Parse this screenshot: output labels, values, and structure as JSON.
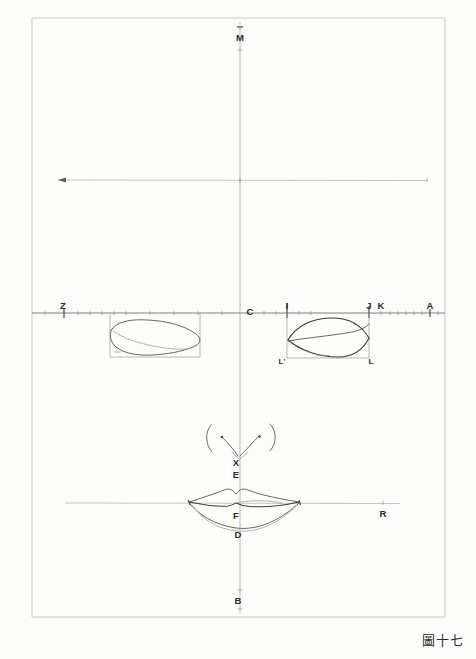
{
  "figure": {
    "caption": "圖十七",
    "caption_meaning": "Figure Seventeen",
    "sheet_width": 476,
    "sheet_height": 659,
    "background_color": "#fdfdfc",
    "ink_color": "#3c3c3a"
  },
  "frame": {
    "left": 32,
    "top": 18,
    "right": 445,
    "bottom": 617
  },
  "axes": {
    "vertical": {
      "label_top": "M",
      "label_bottom": "B",
      "x": 240,
      "y_top": 24,
      "y_bottom": 612
    },
    "horizontal_upper": {
      "label_left": "Z",
      "label_center": "C",
      "label_right": "A",
      "y": 313,
      "x_left": 32,
      "x_right": 445
    },
    "horizontal_mid": {
      "y": 180,
      "x_left": 57,
      "x_right": 428,
      "has_arrowhead_left": true
    },
    "horizontal_lower": {
      "label_right": "R",
      "y": 503,
      "x_left": 65,
      "x_right": 400
    }
  },
  "points": [
    {
      "id": "M",
      "label": "M",
      "x": 240,
      "y": 38,
      "desc": "top of vertical axis"
    },
    {
      "id": "Z",
      "label": "Z",
      "x": 63,
      "y": 306,
      "desc": "left end of upper horizontal axis"
    },
    {
      "id": "C",
      "label": "C",
      "x": 250,
      "y": 312,
      "desc": "center on upper horizontal axis"
    },
    {
      "id": "I",
      "label": "I",
      "x": 287,
      "y": 306,
      "desc": "left boundary of right lens"
    },
    {
      "id": "J",
      "label": "J",
      "x": 369,
      "y": 306,
      "desc": "right boundary of right lens"
    },
    {
      "id": "K",
      "label": "K",
      "x": 381,
      "y": 306,
      "desc": "point right of J"
    },
    {
      "id": "A",
      "label": "A",
      "x": 430,
      "y": 306,
      "desc": "right end of upper horizontal axis"
    },
    {
      "id": "Lp",
      "label": "L'",
      "x": 280,
      "y": 361,
      "desc": "lower-left corner of right rectangle"
    },
    {
      "id": "L",
      "label": "L",
      "x": 370,
      "y": 361,
      "desc": "lower-right corner of right rectangle"
    },
    {
      "id": "X",
      "label": "X",
      "x": 236,
      "y": 463,
      "desc": "philtrum top point"
    },
    {
      "id": "E",
      "label": "E",
      "x": 236,
      "y": 475,
      "desc": "upper lip cupid bow notch"
    },
    {
      "id": "F",
      "label": "F",
      "x": 236,
      "y": 516,
      "desc": "lip parting line midpoint"
    },
    {
      "id": "D",
      "label": "D",
      "x": 238,
      "y": 535,
      "desc": "bottom of lower lip"
    },
    {
      "id": "B",
      "label": "B",
      "x": 238,
      "y": 601,
      "desc": "bottom of vertical axis"
    },
    {
      "id": "R",
      "label": "R",
      "x": 383,
      "y": 514,
      "desc": "right end of lower horizontal axis"
    }
  ],
  "shapes": {
    "left_lens": {
      "name": "left-lens-outline",
      "x_left": 110,
      "x_right": 200,
      "y_top": 320,
      "y_bottom": 356
    },
    "right_lens": {
      "name": "right-lens-outline",
      "x_left": 287,
      "x_right": 369,
      "y_top": 318,
      "y_bottom": 358
    },
    "right_rect": {
      "name": "right-construction-rectangle",
      "x_left": 287,
      "x_right": 369,
      "y_top": 313,
      "y_bottom": 358
    },
    "left_rect": {
      "name": "left-construction-rectangle",
      "x_left": 110,
      "x_right": 200,
      "y_top": 313,
      "y_bottom": 357
    },
    "mouth": {
      "name": "mouth-outline",
      "x_left": 188,
      "x_right": 300,
      "y_top_lip": 490,
      "y_parting": 503,
      "y_bottom_lip": 529
    },
    "nose": {
      "name": "nose-nostril-curves",
      "x_left": 205,
      "x_right": 276,
      "y_top": 424,
      "y_bottom": 452
    }
  },
  "ticks": {
    "upper_axis_minor_count": 22,
    "major_at": [
      "Z",
      "I",
      "J",
      "A"
    ]
  }
}
